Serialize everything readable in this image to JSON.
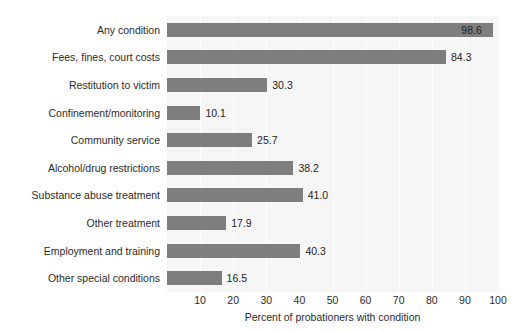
{
  "chart_data": {
    "type": "bar",
    "orientation": "horizontal",
    "title": "",
    "xlabel": "Percent of probationers with condition",
    "ylabel": "",
    "xlim": [
      0,
      100
    ],
    "xticks": [
      10,
      20,
      30,
      40,
      50,
      60,
      70,
      80,
      90,
      100
    ],
    "xtick_labels": [
      "10",
      "20",
      "30",
      "40",
      "50",
      "60",
      "70",
      "80",
      "90",
      "100"
    ],
    "grid": "vertical-white-gridlines",
    "legend": "none",
    "categories": [
      "Any condition",
      "Fees, fines, court costs",
      "Restitution to victim",
      "Confinement/monitoring",
      "Community service",
      "Alcohol/drug restrictions",
      "Substance abuse treatment",
      "Other treatment",
      "Employment and training",
      "Other special conditions"
    ],
    "values": [
      98.6,
      84.3,
      30.3,
      10.1,
      25.7,
      38.2,
      41.0,
      17.9,
      40.3,
      16.5
    ],
    "value_labels": [
      "98.6",
      "84.3",
      "30.3",
      "10.1",
      "25.7",
      "38.2",
      "41.0",
      "17.9",
      "40.3",
      "16.5"
    ],
    "label_placement": [
      "inside",
      "outside",
      "outside",
      "outside",
      "outside",
      "outside",
      "outside",
      "outside",
      "outside",
      "outside"
    ],
    "colors": {
      "bar": "#7e7e7e",
      "plot_background": "#f6f6f7",
      "gridline": "#ffffff",
      "page_background": "#ffffff",
      "text": "#2b2b2b"
    }
  }
}
